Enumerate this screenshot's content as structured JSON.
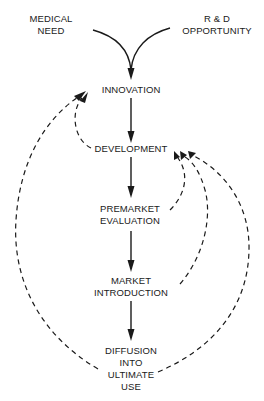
{
  "diagram": {
    "type": "flowchart",
    "sources": [
      {
        "id": "medical_need",
        "lines": [
          "MEDICAL",
          "NEED"
        ]
      },
      {
        "id": "rd_opportunity",
        "lines": [
          "R & D",
          "OPPORTUNITY"
        ]
      }
    ],
    "stages": [
      {
        "id": "innovation",
        "lines": [
          "INNOVATION"
        ]
      },
      {
        "id": "development",
        "lines": [
          "DEVELOPMENT"
        ]
      },
      {
        "id": "premarket_evaluation",
        "lines": [
          "PREMARKET",
          "EVALUATION"
        ]
      },
      {
        "id": "market_introduction",
        "lines": [
          "MARKET",
          "INTRODUCTION"
        ]
      },
      {
        "id": "diffusion",
        "lines": [
          "DIFFUSION",
          "INTO",
          "ULTIMATE",
          "USE"
        ]
      }
    ],
    "edges": [
      {
        "from": "medical_need",
        "to": "innovation",
        "style": "solid"
      },
      {
        "from": "rd_opportunity",
        "to": "innovation",
        "style": "solid"
      },
      {
        "from": "innovation",
        "to": "development",
        "style": "solid"
      },
      {
        "from": "development",
        "to": "premarket_evaluation",
        "style": "solid"
      },
      {
        "from": "premarket_evaluation",
        "to": "market_introduction",
        "style": "solid"
      },
      {
        "from": "market_introduction",
        "to": "diffusion",
        "style": "solid"
      },
      {
        "from": "development",
        "to": "innovation",
        "style": "dashed",
        "kind": "feedback"
      },
      {
        "from": "diffusion",
        "to": "innovation",
        "style": "dashed",
        "kind": "feedback"
      },
      {
        "from": "premarket_evaluation",
        "to": "development",
        "style": "dashed",
        "kind": "feedback"
      },
      {
        "from": "market_introduction",
        "to": "development",
        "style": "dashed",
        "kind": "feedback"
      },
      {
        "from": "diffusion",
        "to": "development",
        "style": "dashed",
        "kind": "feedback"
      }
    ],
    "colors": {
      "ink": "#1a1a1a",
      "background": "#ffffff"
    }
  }
}
